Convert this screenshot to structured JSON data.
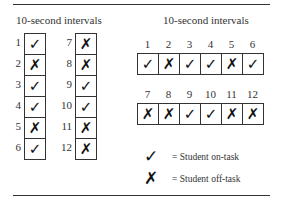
{
  "left_panel": {
    "title": "10-second intervals",
    "column1": [
      {
        "n": "1",
        "mark": "✓",
        "status": "on-task"
      },
      {
        "n": "2",
        "mark": "✗",
        "status": "off-task"
      },
      {
        "n": "3",
        "mark": "✓",
        "status": "on-task"
      },
      {
        "n": "4",
        "mark": "✓",
        "status": "on-task"
      },
      {
        "n": "5",
        "mark": "✗",
        "status": "off-task"
      },
      {
        "n": "6",
        "mark": "✓",
        "status": "on-task"
      }
    ],
    "column2": [
      {
        "n": "7",
        "mark": "✗",
        "status": "off-task"
      },
      {
        "n": "8",
        "mark": "✗",
        "status": "off-task"
      },
      {
        "n": "9",
        "mark": "✓",
        "status": "on-task"
      },
      {
        "n": "10",
        "mark": "✓",
        "status": "on-task"
      },
      {
        "n": "11",
        "mark": "✗",
        "status": "off-task"
      },
      {
        "n": "12",
        "mark": "✗",
        "status": "off-task"
      }
    ]
  },
  "right_panel": {
    "title": "10-second intervals",
    "row1": [
      {
        "n": "1",
        "mark": "✓"
      },
      {
        "n": "2",
        "mark": "✗"
      },
      {
        "n": "3",
        "mark": "✓"
      },
      {
        "n": "4",
        "mark": "✓"
      },
      {
        "n": "5",
        "mark": "✗"
      },
      {
        "n": "6",
        "mark": "✓"
      }
    ],
    "row2": [
      {
        "n": "7",
        "mark": "✗"
      },
      {
        "n": "8",
        "mark": "✗"
      },
      {
        "n": "9",
        "mark": "✓"
      },
      {
        "n": "10",
        "mark": "✓"
      },
      {
        "n": "11",
        "mark": "✗"
      },
      {
        "n": "12",
        "mark": "✗"
      }
    ]
  },
  "legend": {
    "on_task_mark": "✓",
    "on_task_label": "= Student on-task",
    "off_task_mark": "✗",
    "off_task_label": "= Student off-task"
  }
}
